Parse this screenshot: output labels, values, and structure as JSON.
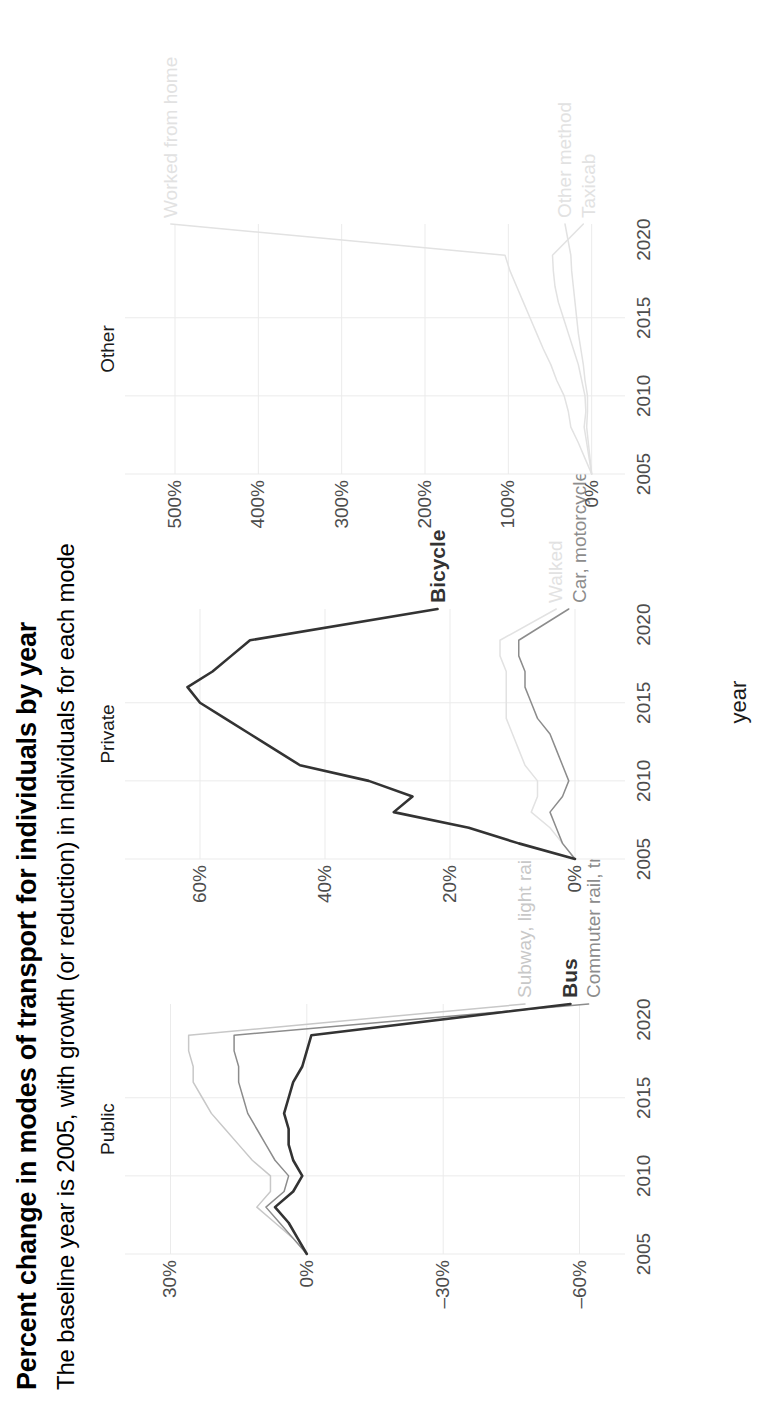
{
  "header": {
    "title": "Percent change in modes of transport for individuals by year",
    "subtitle": "The baseline year is 2005, with growth (or reduction) in individuals for each mode"
  },
  "axis": {
    "x_title": "year",
    "x_ticks": [
      "2005",
      "2010",
      "2015",
      "2020"
    ]
  },
  "facets": [
    {
      "name": "Public",
      "strip_label": "Public",
      "y_ticks": [
        "30%",
        "0%",
        "–30%",
        "–60%"
      ]
    },
    {
      "name": "Private",
      "strip_label": "Private",
      "y_ticks": [
        "60%",
        "40%",
        "20%",
        "0%"
      ]
    },
    {
      "name": "Other",
      "strip_label": "Other",
      "y_ticks": [
        "500%",
        "400%",
        "300%",
        "200%",
        "100%",
        "0%"
      ]
    }
  ],
  "series_labels": {
    "subway": "Subway, light rail",
    "bus": "Bus",
    "commuter": "Commuter rail, train",
    "bicycle": "Bicycle",
    "walked": "Walked",
    "car": "Car, motorcycle",
    "home": "Worked from home",
    "taxicab": "Taxicab",
    "other": "Other method"
  },
  "colors": {
    "highlight": "#333333",
    "mid_gray": "#8c8c8c",
    "light_gray": "#c8c8c8",
    "very_light_gray": "#e2e2e2",
    "grid": "#ebebeb",
    "tick_text": "#4d4d4d",
    "background": "#ffffff"
  },
  "chart_data": {
    "type": "line",
    "title": "Percent change in modes of transport for individuals by year",
    "subtitle": "The baseline year is 2005, with growth (or reduction) in individuals for each mode",
    "xlabel": "year",
    "ylabel": "",
    "grid": true,
    "legend": "line-end labels",
    "x": [
      2005,
      2006,
      2007,
      2008,
      2009,
      2010,
      2011,
      2012,
      2013,
      2014,
      2015,
      2016,
      2017,
      2018,
      2019,
      2021
    ],
    "xlim": [
      2005,
      2021
    ],
    "panels": [
      {
        "facet": "Public",
        "ylim": [
          -70,
          40
        ],
        "yticks": [
          30,
          0,
          -30,
          -60
        ],
        "series": [
          {
            "name": "Subway, light rail",
            "emphasis": "low",
            "color": "#c8c8c8",
            "values": [
              0,
              3,
              7,
              11,
              8,
              8,
              12,
              15,
              18,
              21,
              23,
              25,
              25,
              26,
              26,
              -48
            ]
          },
          {
            "name": "Bus",
            "emphasis": "high",
            "color": "#333333",
            "values": [
              0,
              2,
              4,
              7,
              3,
              1,
              3,
              4,
              4,
              5,
              4,
              3,
              1,
              0,
              -1,
              -58
            ]
          },
          {
            "name": "Commuter rail, train",
            "emphasis": "medium",
            "color": "#8c8c8c",
            "values": [
              0,
              3,
              6,
              9,
              5,
              4,
              7,
              9,
              11,
              13,
              14,
              15,
              15,
              16,
              16,
              -62
            ]
          }
        ]
      },
      {
        "facet": "Private",
        "ylim": [
          -8,
          72
        ],
        "yticks": [
          60,
          40,
          20,
          0
        ],
        "series": [
          {
            "name": "Bicycle",
            "emphasis": "high",
            "color": "#333333",
            "values": [
              0,
              9,
              17,
              29,
              26,
              33,
              44,
              48,
              52,
              56,
              60,
              62,
              58,
              55,
              52,
              22
            ]
          },
          {
            "name": "Walked",
            "emphasis": "low",
            "color": "#e2e2e2",
            "values": [
              0,
              2,
              4,
              7,
              6,
              6,
              8,
              9,
              10,
              11,
              11,
              11,
              11,
              12,
              12,
              3
            ]
          },
          {
            "name": "Car, motorcycle",
            "emphasis": "medium",
            "color": "#8c8c8c",
            "values": [
              0,
              2,
              3,
              4,
              2,
              1,
              2,
              3,
              4,
              6,
              7,
              8,
              8,
              9,
              9,
              1
            ]
          }
        ]
      },
      {
        "facet": "Other",
        "ylim": [
          -40,
          560
        ],
        "yticks": [
          500,
          400,
          300,
          200,
          100,
          0
        ],
        "series": [
          {
            "name": "Worked from home",
            "emphasis": "low",
            "color": "#e2e2e2",
            "values": [
              0,
              8,
              16,
              25,
              28,
              33,
              42,
              49,
              58,
              66,
              74,
              82,
              90,
              98,
              104,
              505
            ]
          },
          {
            "name": "Taxicab",
            "emphasis": "low",
            "color": "#e2e2e2",
            "values": [
              0,
              3,
              6,
              9,
              7,
              8,
              12,
              16,
              22,
              28,
              34,
              40,
              44,
              46,
              47,
              10
            ]
          },
          {
            "name": "Other method",
            "emphasis": "low",
            "color": "#e2e2e2",
            "values": [
              0,
              2,
              4,
              6,
              5,
              5,
              8,
              10,
              13,
              16,
              18,
              20,
              22,
              24,
              25,
              32
            ]
          }
        ]
      }
    ]
  }
}
